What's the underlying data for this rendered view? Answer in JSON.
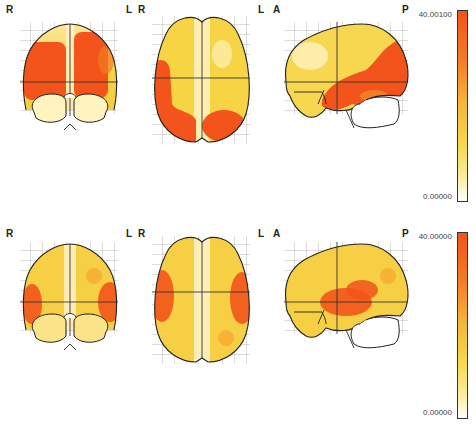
{
  "figure": {
    "rows": [
      {
        "id": "row-1",
        "colorbar": {
          "max_label": "40.00100",
          "min_label": "0.00000",
          "max": 40.001,
          "min": 0.0
        },
        "views": [
          {
            "view": "coronal",
            "left_label": "R",
            "right_label": "L"
          },
          {
            "view": "axial",
            "left_label": "R",
            "right_label": "L"
          },
          {
            "view": "sagittal",
            "left_label": "A",
            "right_label": "P"
          }
        ]
      },
      {
        "id": "row-2",
        "colorbar": {
          "max_label": "40.00000",
          "min_label": "0.00000",
          "max": 40.0,
          "min": 0.0
        },
        "views": [
          {
            "view": "coronal",
            "left_label": "R",
            "right_label": "L"
          },
          {
            "view": "axial",
            "left_label": "R",
            "right_label": "L"
          },
          {
            "view": "sagittal",
            "left_label": "A",
            "right_label": "P"
          }
        ]
      }
    ],
    "colormap": {
      "low": "#ffffff",
      "mid": "#f5d020",
      "high": "#f2541b"
    }
  }
}
